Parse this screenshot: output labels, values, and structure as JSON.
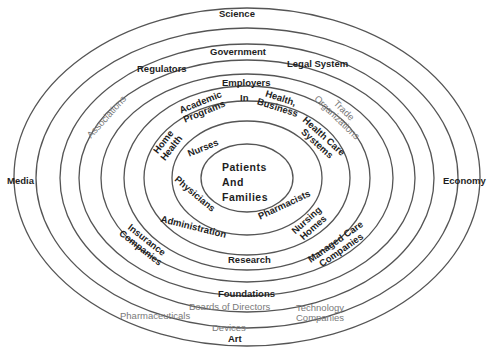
{
  "diagram": {
    "colors": {
      "ring_stroke": "#555555",
      "label_dark": "#1e1e1e",
      "label_gray": "#7a7a7a",
      "background": "#ffffff"
    },
    "center": {
      "line1": "Patients",
      "line2": "And",
      "line3": "Families"
    },
    "rings": [
      {
        "level": 1,
        "labels": [
          "Nurses",
          "Physicians",
          "Pharmacists"
        ]
      },
      {
        "level": 2,
        "labels": [
          "Home Health",
          "Administration",
          "Health Care Systems",
          "Nursing Homes"
        ]
      },
      {
        "level": 3,
        "labels": [
          "Academic Programs",
          "Insurance Companies",
          "Managed Care Companies",
          "Research"
        ]
      },
      {
        "level": 4,
        "labels": [
          "Employers",
          "In",
          "Health, Business"
        ]
      },
      {
        "level": 5,
        "labels": [
          "Associations",
          "Trade Organizations",
          "Foundations"
        ]
      },
      {
        "level": 6,
        "labels": [
          "Regulators",
          "Legal System",
          "Boards of Directors",
          "Technology Companies"
        ]
      },
      {
        "level": 7,
        "labels": [
          "Government",
          "Pharmaceuticals",
          "Devices"
        ]
      },
      {
        "level": 8,
        "labels": [
          "Science",
          "Art",
          "Media",
          "Economy"
        ]
      }
    ],
    "labels": {
      "patients": "Patients",
      "and": "And",
      "families": "Families",
      "nurses": "Nurses",
      "physicians": "Physicians",
      "pharmacists": "Pharmacists",
      "home": "Home",
      "health": "Health",
      "administration": "Administration",
      "health_care": "Health Care",
      "systems": "Systems",
      "nursing": "Nursing",
      "homes": "Homes",
      "academic": "Academic",
      "programs": "Programs",
      "insurance": "Insurance",
      "companies": "Companies",
      "managed_care": "Managed Care",
      "companies2": "Companies",
      "research": "Research",
      "employers": "Employers",
      "in": "In",
      "health_comma": "Health,",
      "business": "Business",
      "associations": "Associations",
      "trade": "Trade",
      "organizations": "Organizations",
      "foundations": "Foundations",
      "regulators": "Regulators",
      "legal_system": "Legal System",
      "boards": "Boards of Directors",
      "technology": "Technology",
      "companies3": "Companies",
      "government": "Government",
      "pharmaceuticals": "Pharmaceuticals",
      "devices": "Devices",
      "science": "Science",
      "art": "Art",
      "media": "Media",
      "economy": "Economy"
    }
  }
}
